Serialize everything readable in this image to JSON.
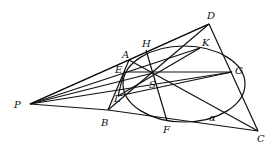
{
  "diagram": {
    "type": "geometry",
    "points": {
      "P": {
        "label": "P",
        "x": 30,
        "y": 104,
        "lx": 14,
        "ly": 108
      },
      "A": {
        "label": "A",
        "x": 129,
        "y": 60,
        "lx": 122,
        "ly": 58
      },
      "B": {
        "label": "B",
        "x": 108,
        "y": 110,
        "lx": 101,
        "ly": 126
      },
      "D": {
        "label": "D",
        "x": 209,
        "y": 24,
        "lx": 207,
        "ly": 19
      },
      "C": {
        "label": "C",
        "x": 258,
        "y": 131,
        "lx": 257,
        "ly": 142
      },
      "H": {
        "label": "H",
        "x": 146,
        "y": 50,
        "lx": 142,
        "ly": 47
      },
      "K": {
        "label": "K",
        "x": 200,
        "y": 48,
        "lx": 202,
        "ly": 46
      },
      "G": {
        "label": "G",
        "x": 232,
        "y": 72,
        "lx": 235,
        "ly": 74
      },
      "E": {
        "label": "E",
        "x": 124,
        "y": 72,
        "lx": 115,
        "ly": 73
      },
      "L": {
        "label": "L",
        "x": 118,
        "y": 96,
        "lx": 114,
        "ly": 102
      },
      "F": {
        "label": "F",
        "x": 167,
        "y": 121,
        "lx": 163,
        "ly": 133
      },
      "S": {
        "label": "S",
        "x": 153,
        "y": 73,
        "lx": 149,
        "ly": 88
      },
      "alpha": {
        "label": "α",
        "x": 0,
        "y": 0,
        "lx": 209,
        "ly": 121
      }
    },
    "ellipse": {
      "cx": 184,
      "cy": 84,
      "rx": 61,
      "ry": 38
    },
    "segments": [
      [
        "P",
        "A"
      ],
      [
        "P",
        "D"
      ],
      [
        "P",
        "B"
      ],
      [
        "P",
        "C"
      ],
      [
        "P",
        "E"
      ],
      [
        "P",
        "G"
      ],
      [
        "P",
        "K"
      ],
      [
        "A",
        "B"
      ],
      [
        "A",
        "D"
      ],
      [
        "B",
        "C"
      ],
      [
        "D",
        "C"
      ],
      [
        "H",
        "F"
      ],
      [
        "E",
        "G"
      ],
      [
        "A",
        "C"
      ],
      [
        "D",
        "B"
      ],
      [
        "L",
        "K"
      ],
      [
        "E",
        "C"
      ]
    ]
  }
}
